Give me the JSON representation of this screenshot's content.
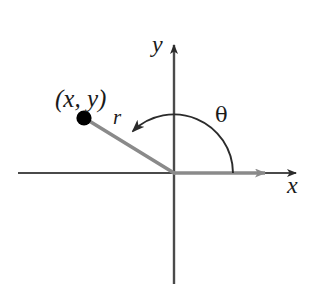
{
  "figure": {
    "type": "polar-coordinate-diagram",
    "background_color": "#ffffff"
  },
  "labels": {
    "point": "(x, y)",
    "radius": "r",
    "angle": "θ",
    "y_axis": "y",
    "x_axis": "x"
  },
  "colors": {
    "axis": "#4a4a4a",
    "ray": "#8a8a8a",
    "arc": "#2b2b2b",
    "point_dot": "#000000",
    "text": "#1a1a1a"
  },
  "geometry": {
    "origin": {
      "x": 174,
      "y": 173
    },
    "point": {
      "x": 84,
      "y": 118
    },
    "x_axis": {
      "x1": 18,
      "y1": 173,
      "x2": 303,
      "y2": 173
    },
    "y_axis": {
      "x1": 174,
      "y1": 40,
      "x2": 174,
      "y2": 284
    },
    "terminal_ray_tip": {
      "x": 272,
      "y": 173
    },
    "arc_radius": 59,
    "arc_start_angle_deg": 0,
    "arc_end_angle_deg": 148
  }
}
